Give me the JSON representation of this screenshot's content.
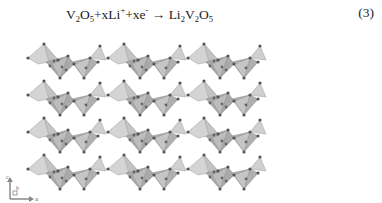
{
  "equation": {
    "lhs_1": "V",
    "lhs_1_sub": "2",
    "lhs_2": "O",
    "lhs_2_sub": "5",
    "plus_1": "+xLi",
    "li_sup": "+",
    "plus_2": "+xe",
    "e_sup": "-",
    "arrow": " → ",
    "rhs_1": "Li",
    "rhs_1_sub": "2",
    "rhs_2": "V",
    "rhs_2_sub": "2",
    "rhs_3": "O",
    "rhs_3_sub": "5",
    "number": "(3)"
  },
  "figure": {
    "layers": 4,
    "polyhedron_fill": "#b8b8b8",
    "atom_color": "#555555"
  },
  "axes": {
    "c_label": "c",
    "b_label": "b",
    "a_label": "a"
  }
}
